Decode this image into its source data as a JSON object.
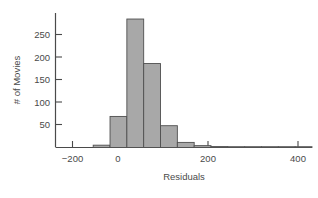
{
  "chart_data": {
    "type": "bar",
    "title": "",
    "subtitle": "",
    "xlabel": "Residuals",
    "ylabel": "# of Movies",
    "xlim": [
      -262,
      500
    ],
    "ylim": [
      0,
      290
    ],
    "xticks": [
      -200,
      0,
      200,
      400
    ],
    "xtick_labels": [
      "−200",
      "0",
      "200",
      "400"
    ],
    "yticks": [
      50,
      100,
      150,
      200,
      250
    ],
    "ytick_labels": [
      "50",
      "100",
      "150",
      "200",
      "250"
    ],
    "grid": false,
    "legend": null,
    "bin_width": 50,
    "bin_edges": [
      -150,
      -100,
      -50,
      0,
      50,
      100,
      150,
      200,
      250,
      300,
      350,
      400,
      450,
      500
    ],
    "categories": [
      "-150 to -100",
      "-100 to -50",
      "-50 to 0",
      "0 to 50",
      "50 to 100",
      "100 to 150",
      "150 to 200",
      "200 to 250",
      "250 to 300",
      "300 to 350",
      "350 to 400",
      "400 to 450",
      "450 to 500"
    ],
    "values": [
      5,
      67,
      277,
      181,
      47,
      11,
      4,
      2,
      1,
      1,
      0,
      0,
      1
    ],
    "bar_fill": "#a8a8a8",
    "bar_stroke": "#4f4f4f",
    "axis_color": "#4a4a4a"
  },
  "axes": {
    "x_title": "Residuals",
    "y_title": "# of Movies"
  }
}
